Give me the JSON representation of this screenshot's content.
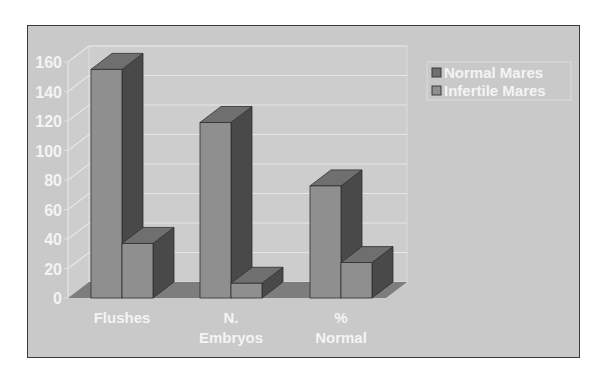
{
  "chart_data": {
    "type": "bar",
    "subtype": "3d-clustered-column",
    "title": "",
    "xlabel": "",
    "ylabel": "",
    "categories": [
      "Flushes",
      "N. Embryos",
      "% Normal"
    ],
    "category_lines": [
      [
        "Flushes"
      ],
      [
        "N.",
        "Embryos"
      ],
      [
        "%",
        "Normal"
      ]
    ],
    "series": [
      {
        "name": "Normal Mares",
        "values": [
          155,
          119,
          76
        ]
      },
      {
        "name": "Infertile Mares",
        "values": [
          37,
          10,
          24
        ]
      }
    ],
    "ylim": [
      0,
      160
    ],
    "yticks": [
      0,
      20,
      40,
      60,
      80,
      100,
      120,
      140,
      160
    ],
    "grid": true,
    "legend_position": "right-top"
  },
  "legend": {
    "items": [
      "Normal Mares",
      "Infertile Mares"
    ]
  },
  "colors": {
    "background": "#c9c9c9",
    "wall": "#cdcdcd",
    "gridline": "#e6e6e6",
    "floor": "#7d7d7d",
    "bar_front": "#8f8f8f",
    "bar_top": "#6f6f6f",
    "bar_side": "#494949",
    "text": "#f4f4f4"
  }
}
